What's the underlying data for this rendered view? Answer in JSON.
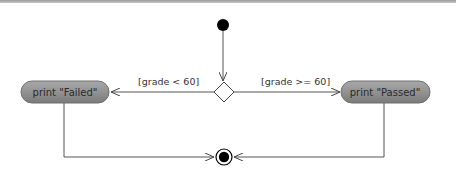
{
  "diagram": {
    "type": "UML activity diagram",
    "initial_node": {
      "label": ""
    },
    "decision": {
      "label": ""
    },
    "actions": [
      {
        "id": "failed",
        "label": "print \"Failed\""
      },
      {
        "id": "passed",
        "label": "print \"Passed\""
      }
    ],
    "guards": [
      {
        "to": "failed",
        "label": "[grade < 60]"
      },
      {
        "to": "passed",
        "label": "[grade >= 60]"
      }
    ],
    "final_node": {
      "label": ""
    }
  },
  "colors": {
    "action_fill": "#8f8f8f",
    "action_stroke": "#6f6f6f",
    "line": "#555555",
    "node": "#000000"
  }
}
